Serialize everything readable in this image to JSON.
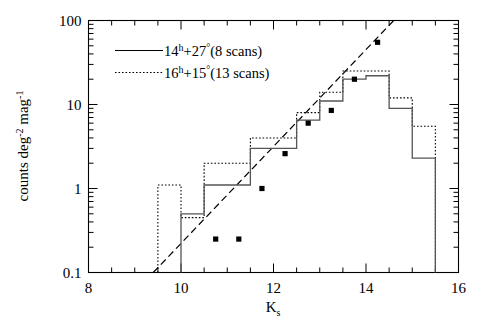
{
  "figure": {
    "name": "k-band-number-counts-histogram",
    "background": "#ffffff",
    "foreground": "#000000"
  },
  "axes": {
    "x": {
      "label": "K",
      "label_sub": "s",
      "min": 8,
      "max": 16,
      "scale": "linear",
      "major_ticks": [
        8,
        10,
        12,
        14,
        16
      ],
      "major_tick_labels": [
        "8",
        "10",
        "12",
        "14",
        "16"
      ],
      "minor_tick_step": 0.5
    },
    "y": {
      "label": "counts deg",
      "label_sup1": "-2",
      "label_mid": " mag",
      "label_sup2": "-1",
      "min": 0.1,
      "max": 100,
      "scale": "log",
      "major_ticks": [
        0.1,
        1,
        10,
        100
      ],
      "major_tick_labels": [
        "0.1",
        "1",
        "10",
        "100"
      ]
    }
  },
  "legend": {
    "entries": [
      {
        "key": "field-14h27",
        "style": "solid",
        "ra": "14",
        "ra_unit": "h",
        "sign": "+",
        "dec": "27",
        "dec_unit": "°",
        "detail": "(8 scans)",
        "color": "#000000"
      },
      {
        "key": "field-16h15",
        "style": "dotted",
        "ra": "16",
        "ra_unit": "h",
        "sign": "+",
        "dec": "15",
        "dec_unit": "°",
        "detail": "(13 scans)",
        "color": "#000000"
      }
    ]
  },
  "chart_data": {
    "type": "line",
    "title": "",
    "xlabel": "K_s",
    "ylabel": "counts deg^-2 mag^-1",
    "xlim": [
      8,
      16
    ],
    "ylim": [
      0.1,
      100
    ],
    "yscale": "log",
    "grid": false,
    "legend_position": "top-left",
    "series": [
      {
        "name": "14h+27 (8 scans)",
        "type": "step-histogram",
        "style": "solid",
        "bin_edges": [
          10.0,
          10.5,
          11.0,
          11.5,
          12.0,
          12.5,
          13.0,
          13.5,
          14.0,
          14.5,
          15.0,
          15.5
        ],
        "values": [
          0.5,
          1.1,
          1.1,
          3.0,
          3.0,
          6.5,
          11.0,
          20.0,
          22.0,
          9.0,
          2.3,
          5.5
        ]
      },
      {
        "name": "16h+15 (13 scans)",
        "type": "step-histogram",
        "style": "dotted",
        "bin_edges": [
          9.5,
          10.0,
          10.5,
          11.0,
          11.5,
          12.0,
          12.5,
          13.0,
          13.5,
          14.0,
          14.5,
          15.0,
          15.5
        ],
        "values": [
          1.1,
          0.45,
          2.0,
          2.0,
          4.0,
          4.0,
          8.0,
          14.0,
          25.0,
          25.0,
          12.0,
          5.5,
          5.5
        ]
      },
      {
        "name": "model fit",
        "type": "line",
        "style": "dashed",
        "x": [
          9.4,
          14.6
        ],
        "y": [
          0.1,
          100.0
        ],
        "description": "dashed power-law reference line"
      },
      {
        "name": "data points",
        "type": "scatter",
        "marker": "filled-square",
        "x": [
          10.75,
          11.25,
          11.75,
          12.25,
          12.75,
          13.25,
          13.75,
          14.25
        ],
        "y": [
          0.25,
          0.25,
          1.0,
          2.6,
          6.0,
          8.5,
          20.0,
          55.0
        ]
      }
    ]
  }
}
